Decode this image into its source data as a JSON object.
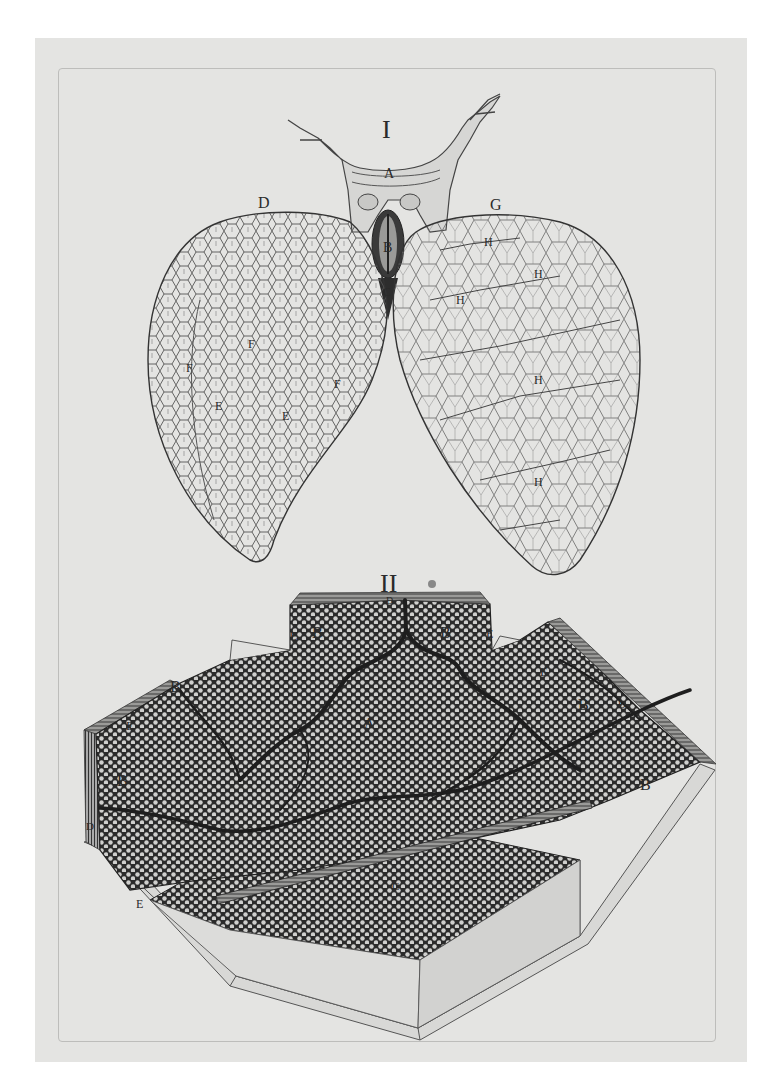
{
  "plate": {
    "description": "Engraved anatomical plate: frog lungs (Fig. I) and magnified section of lung tissue (Fig. II)",
    "paper_color": "#e4e4e2",
    "ink_color": "#2a2a2a"
  },
  "figure_1": {
    "numeral": "I",
    "labels": {
      "trachea": "A",
      "glottis": "B",
      "larynx_base": "C",
      "left_lung": "D",
      "left_lung_marks": [
        "E",
        "E",
        "F",
        "F",
        "F"
      ],
      "right_lung": "G",
      "right_lung_vessels": [
        "H",
        "H",
        "H",
        "H",
        "H"
      ]
    }
  },
  "figure_2": {
    "numeral": "II",
    "labels": {
      "center": "A",
      "cells": [
        "B",
        "B",
        "B",
        "B",
        "B",
        "B"
      ],
      "vessel": "C",
      "edges": [
        "D",
        "D",
        "D"
      ],
      "sections": [
        "E",
        "E",
        "E",
        "E",
        "E"
      ]
    }
  }
}
